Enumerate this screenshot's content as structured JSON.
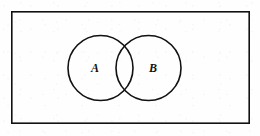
{
  "figure": {
    "kind": "venn-diagram",
    "background_color": "#fefefe",
    "stroke_color": "#111111",
    "label_color": "#111111"
  },
  "universe_rectangle": {
    "name": "universal-set",
    "x": 11,
    "y": 11,
    "width": 239,
    "height": 113,
    "stroke_width": 1.6,
    "fill": "none"
  },
  "sets": [
    {
      "label": "A",
      "name": "set-a",
      "cx": 100.5,
      "cy": 68,
      "r": 32.5,
      "stroke_width": 1.6,
      "fill": "none",
      "label_x": 95,
      "label_y": 68,
      "label_font_size": 12
    },
    {
      "label": "B",
      "name": "set-b",
      "cx": 148.5,
      "cy": 68,
      "r": 32.5,
      "stroke_width": 1.6,
      "fill": "none",
      "label_x": 153,
      "label_y": 68,
      "label_font_size": 12
    }
  ],
  "intersection": {
    "name": "intersection-region",
    "left_x": 116,
    "right_x": 133,
    "center_x": 124.5,
    "center_y": 68,
    "filled": false
  }
}
